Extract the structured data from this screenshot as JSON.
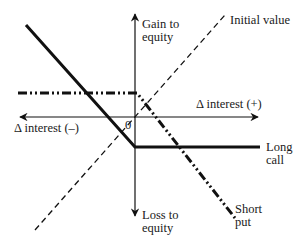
{
  "diagram": {
    "type": "payoff-diagram",
    "axes": {
      "y_positive_label_line1": "Gain to",
      "y_positive_label_line2": "equity",
      "y_negative_label_line1": "Loss to",
      "y_negative_label_line2": "equity",
      "x_positive_label": "Δ interest (+)",
      "x_negative_label": "Δ interest (–)",
      "origin_label": "0"
    },
    "lines": [
      {
        "name": "Initial value",
        "style": "dashed",
        "label_line1": "Initial value",
        "label_line2": ""
      },
      {
        "name": "Long call",
        "style": "solid-thick",
        "label_line1": "Long",
        "label_line2": "call"
      },
      {
        "name": "Short put",
        "style": "dash-dot-dot-thick",
        "label_line1": "Short",
        "label_line2": "put"
      }
    ],
    "colors": {
      "line": "#111111",
      "background": "#ffffff"
    }
  }
}
